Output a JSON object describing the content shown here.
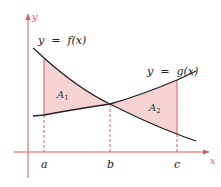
{
  "diagram": {
    "type": "area-between-curves",
    "axes": {
      "x_label": "x",
      "y_label": "y",
      "color": "#e05a5a"
    },
    "curves": [
      {
        "id": "f",
        "label_prefix": "y  =  ",
        "label_fn": "f(x)",
        "color": "#222222"
      },
      {
        "id": "g",
        "label_prefix": "y  =  ",
        "label_fn": "g(x)",
        "color": "#222222"
      }
    ],
    "points": [
      {
        "id": "a",
        "label": "a"
      },
      {
        "id": "b",
        "label": "b"
      },
      {
        "id": "c",
        "label": "c"
      }
    ],
    "regions": [
      {
        "id": "A1",
        "label": "A",
        "subscript": "1",
        "between": "a and b",
        "fill": "#f6d3d3"
      },
      {
        "id": "A2",
        "label": "A",
        "subscript": "2",
        "between": "b and c",
        "fill": "#f6d3d3"
      }
    ],
    "guide_line_color": "#e05a5a"
  }
}
